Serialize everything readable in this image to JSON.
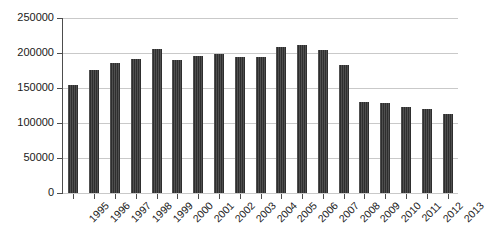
{
  "chart_data": {
    "type": "bar",
    "title": "",
    "subtitle": "",
    "xlabel": "",
    "ylabel": "",
    "grid": true,
    "legend": false,
    "legend_position": "none",
    "bar_color": "#2e2e2e",
    "gridline_color": "#c9c9c9",
    "axis_color": "#4d4d4d",
    "ylim": [
      0,
      250000
    ],
    "ytick_values": [
      0,
      50000,
      100000,
      150000,
      200000,
      250000
    ],
    "ytick_labels": [
      "0",
      "50000",
      "100000",
      "150000",
      "200000",
      "250000"
    ],
    "categories": [
      "1995",
      "1996",
      "1997",
      "1998",
      "1999",
      "2000",
      "2001",
      "2002",
      "2003",
      "2004",
      "2005",
      "2006",
      "2007",
      "2008",
      "2009",
      "2010",
      "2011",
      "2012",
      "2013"
    ],
    "values": [
      154000,
      176000,
      186000,
      192000,
      206000,
      190000,
      196000,
      199000,
      195000,
      194000,
      208000,
      212000,
      205000,
      183000,
      130000,
      128000,
      123000,
      120000,
      113000
    ]
  }
}
